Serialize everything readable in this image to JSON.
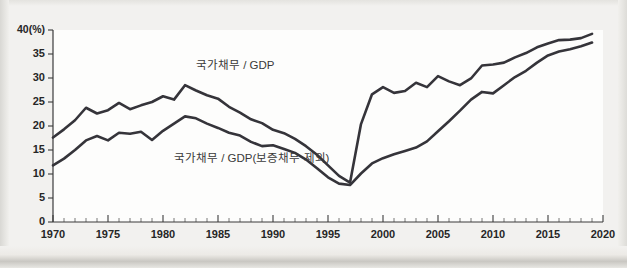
{
  "chart_data": {
    "type": "line",
    "title": "",
    "subtitle": "",
    "xlabel": "",
    "ylabel": "",
    "y_unit_label": "40(%)",
    "xlim": [
      1970,
      2020
    ],
    "ylim": [
      0,
      40
    ],
    "grid": false,
    "legend_position": "inline-annotation",
    "y_ticks": [
      0,
      5,
      10,
      15,
      20,
      25,
      30,
      35,
      40
    ],
    "y_tick_labels": [
      "0",
      "5",
      "10",
      "15",
      "20",
      "25",
      "30",
      "35",
      "40(%)"
    ],
    "x_ticks": [
      1970,
      1975,
      1980,
      1985,
      1990,
      1995,
      2000,
      2005,
      2010,
      2015,
      2020
    ],
    "x_tick_labels": [
      "1970",
      "1975",
      "1980",
      "1985",
      "1990",
      "1995",
      "2000",
      "2005",
      "2010",
      "2015",
      "2020"
    ],
    "x_minor_tick_step": 1,
    "x": [
      1970,
      1971,
      1972,
      1973,
      1974,
      1975,
      1976,
      1977,
      1978,
      1979,
      1980,
      1981,
      1982,
      1983,
      1984,
      1985,
      1986,
      1987,
      1988,
      1989,
      1990,
      1991,
      1992,
      1993,
      1994,
      1995,
      1996,
      1997,
      1998,
      1999,
      2000,
      2001,
      2002,
      2003,
      2004,
      2005,
      2006,
      2007,
      2008,
      2009,
      2010,
      2011,
      2012,
      2013,
      2014,
      2015,
      2016,
      2017,
      2018,
      2019
    ],
    "series": [
      {
        "name": "국가채무 / GDP",
        "color": "#35343a",
        "annotation": "국가채무 / GDP",
        "values": [
          17.6,
          19.3,
          21.2,
          23.8,
          22.6,
          23.3,
          24.8,
          23.5,
          24.3,
          25.0,
          26.2,
          25.5,
          28.5,
          27.4,
          26.4,
          25.7,
          24.0,
          22.8,
          21.4,
          20.6,
          19.2,
          18.5,
          17.3,
          15.8,
          14.0,
          11.8,
          9.6,
          8.2,
          20.4,
          26.6,
          28.1,
          26.9,
          27.3,
          29.0,
          28.1,
          30.4,
          29.3,
          28.5,
          29.9,
          32.6,
          32.8,
          33.2,
          34.3,
          35.2,
          36.4,
          37.2,
          37.9,
          38.0,
          38.3,
          39.2
        ]
      },
      {
        "name": "국가채무 / GDP(보증채무 제외)",
        "color": "#35343a",
        "annotation": "국가채무 / GDP(보증채무 제외)",
        "values": [
          11.8,
          13.2,
          15.0,
          17.0,
          17.9,
          17.0,
          18.6,
          18.4,
          18.8,
          17.1,
          19.0,
          20.5,
          22.0,
          21.6,
          20.5,
          19.6,
          18.6,
          18.0,
          16.7,
          15.8,
          16.0,
          15.2,
          14.4,
          13.0,
          11.2,
          9.3,
          8.0,
          7.7,
          10.1,
          12.2,
          13.3,
          14.1,
          14.8,
          15.5,
          16.8,
          18.9,
          21.0,
          23.2,
          25.5,
          27.1,
          26.8,
          28.5,
          30.2,
          31.5,
          33.2,
          34.7,
          35.5,
          36.0,
          36.6,
          37.4
        ]
      }
    ],
    "annotations": [
      {
        "text": "국가채무 / GDP",
        "x_year": 1983,
        "y_value": 32.5
      },
      {
        "text": "국가채무 / GDP(보증채무 제외)",
        "x_year": 1981,
        "y_value": 13.2
      }
    ]
  }
}
